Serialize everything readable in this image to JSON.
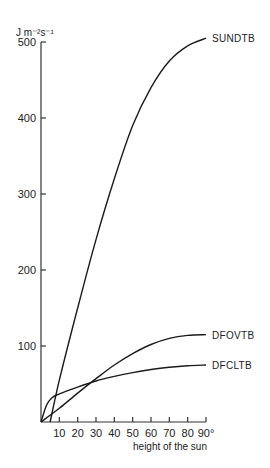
{
  "chart_data": {
    "type": "line",
    "title": "",
    "xlabel": "height of the sun",
    "ylabel": "J m⁻²s⁻¹",
    "xlim": [
      0,
      90
    ],
    "ylim": [
      0,
      500
    ],
    "grid": false,
    "x_ticks": [
      10,
      20,
      30,
      40,
      50,
      60,
      70,
      80,
      90
    ],
    "x_tick_labels": [
      "10",
      "20",
      "30",
      "40",
      "50",
      "60",
      "70",
      "80",
      "90°"
    ],
    "y_ticks": [
      100,
      200,
      300,
      400,
      500
    ],
    "y_tick_labels": [
      "100",
      "200",
      "300",
      "400",
      "500"
    ],
    "series": [
      {
        "name": "SUNDTB",
        "x": [
          5,
          10,
          20,
          30,
          40,
          50,
          60,
          70,
          80,
          90
        ],
        "y": [
          0,
          55,
          150,
          240,
          320,
          390,
          440,
          475,
          495,
          505
        ]
      },
      {
        "name": "DFOVTB",
        "x": [
          0,
          10,
          20,
          30,
          40,
          50,
          60,
          70,
          80,
          90
        ],
        "y": [
          0,
          18,
          38,
          57,
          75,
          90,
          102,
          110,
          114,
          115
        ]
      },
      {
        "name": "DFCLTB",
        "x": [
          0,
          3,
          6,
          10,
          20,
          30,
          40,
          50,
          60,
          70,
          80,
          90
        ],
        "y": [
          0,
          22,
          32,
          37,
          46,
          54,
          60,
          65,
          69,
          72,
          74,
          75
        ]
      }
    ]
  }
}
